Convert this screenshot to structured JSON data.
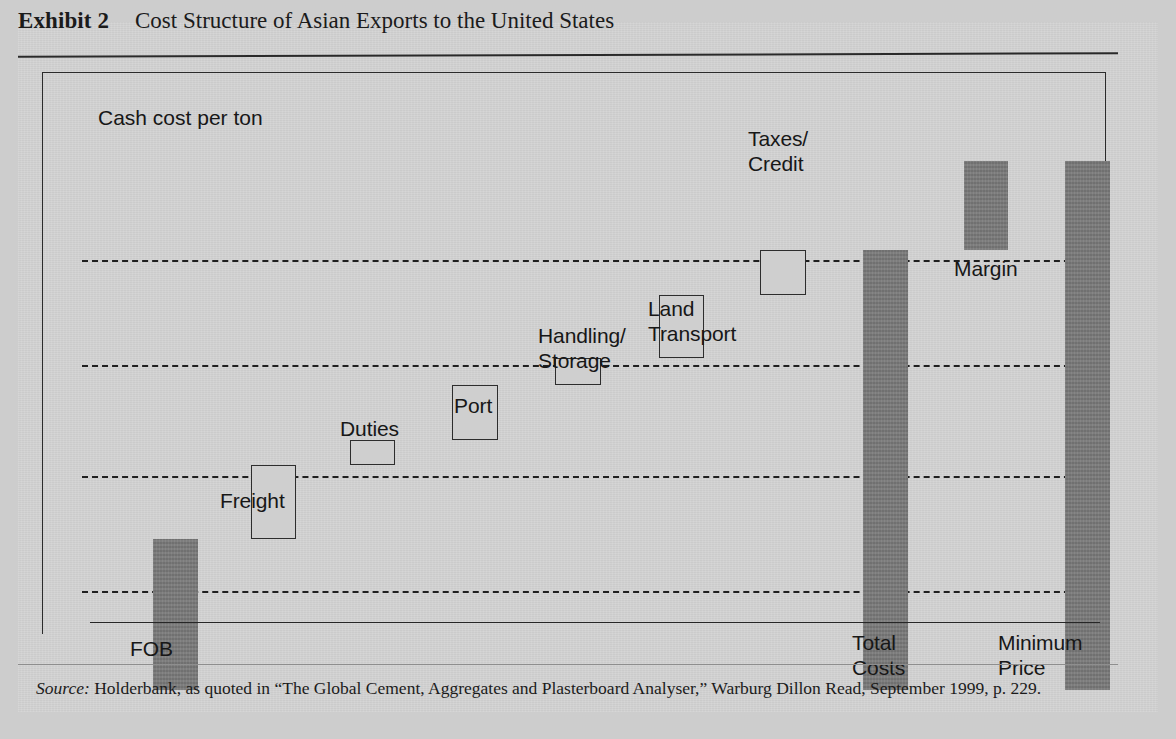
{
  "exhibit": {
    "label": "Exhibit 2",
    "title": "Cost Structure of Asian Exports to the United States"
  },
  "chart_note": "Cash cost per ton",
  "source": {
    "prefix": "Source:",
    "text": " Holderbank, as quoted in “The Global Cement, Aggregates and Plasterboard Analyser,” Warburg Dillon Read, September 1999, p. 229."
  },
  "colors": {
    "page_background": "#cdcdcd",
    "paper": "#d4d4d4",
    "solid_bar": "#7b7b7b",
    "open_bar_fill": "#cfcfcf",
    "outline": "#2d2d2d",
    "gridline": "#1f1f1f",
    "text": "#171717"
  },
  "axis_labels": [
    {
      "text": "FOB",
      "x": 100,
      "y": 568
    },
    {
      "text": "Total\nCosts",
      "x": 822,
      "y": 562
    },
    {
      "text": "Minimum\nPrice",
      "x": 968,
      "y": 562
    }
  ],
  "chart_data": {
    "type": "bar",
    "subtype": "waterfall",
    "title": "Cost Structure of Asian Exports to the United States",
    "ylabel": "Cash cost per ton",
    "xlabel": "",
    "grid": true,
    "gridlines_y": [
      1.0,
      2.0,
      3.0,
      4.1
    ],
    "legend": "none",
    "units": "relative cash cost per ton (unlabeled axis)",
    "categories": [
      "FOB",
      "Freight",
      "Duties",
      "Port",
      "Handling/Storage",
      "Land Transport",
      "Taxes/Credit",
      "Total Costs",
      "Margin",
      "Minimum Price"
    ],
    "values": [
      1.44,
      0.7,
      0.24,
      0.52,
      0.26,
      0.6,
      0.43,
      4.19,
      0.85,
      5.04
    ],
    "bases": [
      0.0,
      1.44,
      2.14,
      2.38,
      2.9,
      3.16,
      3.76,
      0.0,
      4.19,
      0.0
    ],
    "bar_kinds": [
      "total",
      "increment",
      "increment",
      "increment",
      "increment",
      "increment",
      "increment",
      "total",
      "increment",
      "total"
    ],
    "bars": [
      {
        "name": "FOB",
        "kind": "solid",
        "x": 123,
        "y": 471,
        "w": 45,
        "h": 151
      },
      {
        "name": "Freight",
        "kind": "open",
        "x": 221,
        "y": 397,
        "w": 45,
        "h": 74
      },
      {
        "name": "Duties",
        "kind": "open",
        "x": 320,
        "y": 372,
        "w": 45,
        "h": 25
      },
      {
        "name": "Port",
        "kind": "open",
        "x": 422,
        "y": 317,
        "w": 46,
        "h": 55
      },
      {
        "name": "Handling/Storage",
        "kind": "open",
        "x": 525,
        "y": 290,
        "w": 46,
        "h": 27
      },
      {
        "name": "Land Transport",
        "kind": "open",
        "x": 629,
        "y": 227,
        "w": 45,
        "h": 63
      },
      {
        "name": "Taxes/Credit",
        "kind": "open",
        "x": 730,
        "y": 182,
        "w": 46,
        "h": 45
      },
      {
        "name": "Total Costs",
        "kind": "solid",
        "x": 833,
        "y": 182,
        "w": 45,
        "h": 440
      },
      {
        "name": "Margin",
        "kind": "solid",
        "x": 934,
        "y": 93,
        "w": 44,
        "h": 89
      },
      {
        "name": "Minimum Price",
        "kind": "solid",
        "x": 1035,
        "y": 93,
        "w": 45,
        "h": 529
      }
    ],
    "annotations": [
      {
        "text": "Taxes/\nCredit",
        "x": 718,
        "y": 58
      },
      {
        "text": "Margin",
        "x": 924,
        "y": 188
      },
      {
        "text": "Land\nTransport",
        "x": 618,
        "y": 228
      },
      {
        "text": "Handling/\nStorage",
        "x": 508,
        "y": 255
      },
      {
        "text": "Port",
        "x": 424,
        "y": 325
      },
      {
        "text": "Duties",
        "x": 310,
        "y": 348
      },
      {
        "text": "Freight",
        "x": 190,
        "y": 420
      }
    ],
    "gridlines_px": [
      {
        "y": 192,
        "x": 52,
        "w": 1018
      },
      {
        "y": 297,
        "x": 52,
        "w": 1018
      },
      {
        "y": 408,
        "x": 52,
        "w": 1018
      },
      {
        "y": 523,
        "x": 52,
        "w": 1018
      }
    ]
  }
}
